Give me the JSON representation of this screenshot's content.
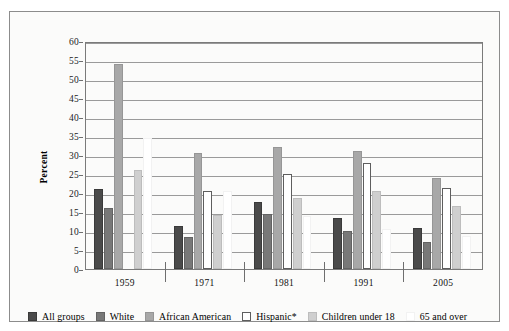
{
  "figure": {
    "top_caption": "",
    "axis_title": "Percent"
  },
  "legend": [
    {
      "label": "All groups",
      "color": "#4a4a4a",
      "border": "#3a3a3a"
    },
    {
      "label": "White",
      "color": "#787878",
      "border": "#636363"
    },
    {
      "label": "African American",
      "color": "#a8a8a8",
      "border": "#969696"
    },
    {
      "label": "Hispanic*",
      "color": "#ffffff",
      "border": "#5e5e5e"
    },
    {
      "label": "Children under 18",
      "color": "#cfcfcf",
      "border": "#bdbdbd"
    },
    {
      "label": "65 and over",
      "color": "#ffffff",
      "border": "#f2f2f2"
    }
  ],
  "chart_data": {
    "type": "bar",
    "title": "",
    "xlabel": "",
    "ylabel": "Percent",
    "ylim": [
      0,
      60
    ],
    "ytick_step": 5,
    "yticks": [
      60,
      55,
      50,
      45,
      40,
      35,
      30,
      25,
      20,
      15,
      10,
      5,
      0
    ],
    "grid": true,
    "legend_position": "bottom",
    "categories": [
      "1959",
      "1971",
      "1981",
      "1991",
      "2005"
    ],
    "series": [
      {
        "name": "All groups",
        "values": [
          21.0,
          11.2,
          17.6,
          13.3,
          10.8
        ]
      },
      {
        "name": "White",
        "values": [
          16.0,
          8.5,
          14.6,
          10.1,
          7.0
        ]
      },
      {
        "name": "African American",
        "values": [
          54.0,
          30.5,
          32.2,
          31.0,
          24.0
        ]
      },
      {
        "name": "Hispanic*",
        "values": [
          null,
          20.6,
          25.1,
          28.0,
          21.3
        ]
      },
      {
        "name": "Children under 18",
        "values": [
          26.0,
          14.3,
          18.8,
          20.6,
          16.5
        ]
      },
      {
        "name": "65 and over",
        "values": [
          34.5,
          20.5,
          14.0,
          10.5,
          8.7
        ]
      }
    ]
  }
}
